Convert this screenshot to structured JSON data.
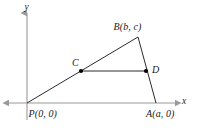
{
  "figure": {
    "type": "geometry-diagram",
    "axes": {
      "x_label": "x",
      "y_label": "y",
      "origin_label": "P(0, 0)",
      "axis_color": "#9a9a9a",
      "x_axis": {
        "x_start": 5,
        "x_end": 178,
        "y": 103
      },
      "y_axis": {
        "x": 27,
        "y_start": 10,
        "y_end": 120
      }
    },
    "points": [
      {
        "name": "P",
        "label": "P(0, 0)",
        "px": 27,
        "py": 103,
        "dot": false
      },
      {
        "name": "A",
        "label": "A(a, 0)",
        "px": 156,
        "py": 103,
        "dot": false
      },
      {
        "name": "B",
        "label": "B(b, c)",
        "px": 138,
        "py": 37,
        "dot": false
      },
      {
        "name": "C",
        "label": "C",
        "px": 81,
        "py": 71,
        "dot": true
      },
      {
        "name": "D",
        "label": "D",
        "px": 146,
        "py": 71,
        "dot": true
      }
    ],
    "segments": [
      {
        "name": "PB",
        "from": "P",
        "to": "B"
      },
      {
        "name": "BA",
        "from": "B",
        "to": "A"
      },
      {
        "name": "CD",
        "from": "C",
        "to": "D"
      }
    ],
    "line_color": "#2b2b2b",
    "dot_color": "#000000"
  }
}
